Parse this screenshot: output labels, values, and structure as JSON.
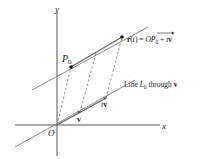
{
  "diagram": {
    "axes": {
      "x_label": "x",
      "y_label": "y",
      "origin_label": "O"
    },
    "points": {
      "p0_label": "P",
      "p0_subscript": "0",
      "v_label": "v",
      "tv_label_t": "t",
      "tv_label_v": "v"
    },
    "equation": {
      "lhs": "r(t) = ",
      "op": "OP",
      "op_subscript": "0",
      "rhs_t": " + t",
      "rhs_v": "v"
    },
    "line_label": {
      "prefix": "Line ",
      "script_l": "L",
      "subscript": "0",
      "suffix": " through ",
      "v": "v"
    },
    "colors": {
      "line": "#8a8a8a",
      "axis": "#555555",
      "dot": "#111111",
      "text": "#222222"
    }
  }
}
